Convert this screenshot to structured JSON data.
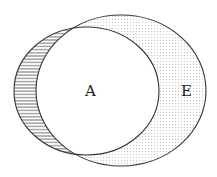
{
  "diagram": {
    "type": "venn",
    "sets": [
      {
        "id": "A",
        "label": "A",
        "fill": "none",
        "outline": "#333333"
      },
      {
        "id": "E",
        "label": "E",
        "fill": "dotted",
        "outline": "#333333"
      }
    ],
    "regions": [
      {
        "name": "A minus E",
        "pattern": "horizontal-hatch"
      },
      {
        "name": "E minus A",
        "pattern": "dots"
      },
      {
        "name": "A intersect E",
        "pattern": "none"
      }
    ],
    "colors": {
      "stroke": "#333333",
      "hatch": "#555555",
      "dots": "#bbbbbb",
      "background": "#ffffff"
    }
  }
}
